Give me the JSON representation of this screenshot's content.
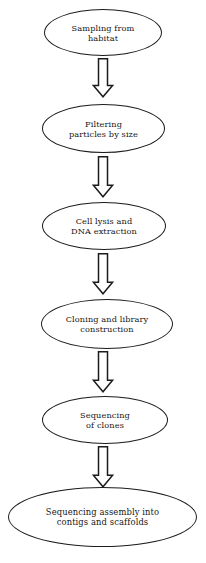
{
  "diagram": {
    "background_color": "#ffffff",
    "stroke_color": "#1c1c1c",
    "text_color": "#161616",
    "shape": "ellipse",
    "connector": "block-arrow-down",
    "nodes": [
      {
        "id": "sampling",
        "label": "Sampling from\nhabitat",
        "line1": "Sampling from",
        "line2": "habitat"
      },
      {
        "id": "filtering",
        "label": "Filtering\nparticles by size",
        "line1": "Filtering",
        "line2": "particles by size"
      },
      {
        "id": "cell-lysis",
        "label": "Cell lysis and\nDNA extraction",
        "line1": "Cell lysis and",
        "line2": "DNA extraction"
      },
      {
        "id": "cloning",
        "label": "Cloning and library\nconstruction",
        "line1": "Cloning and library",
        "line2": "construction"
      },
      {
        "id": "sequencing",
        "label": "Sequencing\nof clones",
        "line1": "Sequencing",
        "line2": "of clones"
      },
      {
        "id": "assembly",
        "label": "Sequencing assembly into\ncontigs and scaffolds",
        "line1": "Sequencing assembly into",
        "line2": "contigs and scaffolds"
      }
    ],
    "arrows": [
      {
        "id": "arrow-1",
        "from": "sampling",
        "to": "filtering"
      },
      {
        "id": "arrow-2",
        "from": "filtering",
        "to": "cell-lysis"
      },
      {
        "id": "arrow-3",
        "from": "cell-lysis",
        "to": "cloning"
      },
      {
        "id": "arrow-4",
        "from": "cloning",
        "to": "sequencing"
      },
      {
        "id": "arrow-5",
        "from": "sequencing",
        "to": "assembly"
      }
    ]
  }
}
